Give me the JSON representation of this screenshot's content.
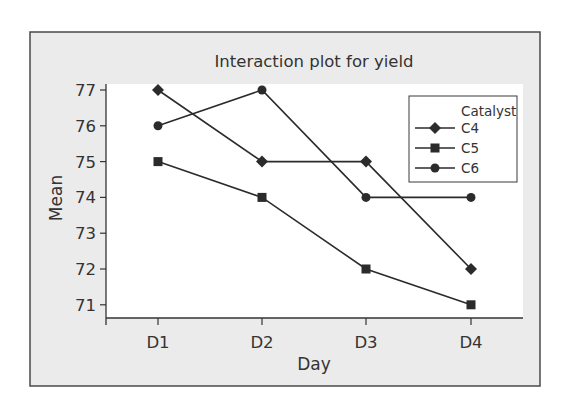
{
  "chart_data": {
    "type": "line",
    "title": "Interaction plot for yield",
    "xlabel": "Day",
    "ylabel": "Mean",
    "categories": [
      "D1",
      "D2",
      "D3",
      "D4"
    ],
    "yticks": [
      71,
      72,
      73,
      74,
      75,
      76,
      77
    ],
    "ylim": [
      70.65,
      77.25
    ],
    "grid": false,
    "legend": {
      "title": "Catalyst",
      "position": "top-right-inside"
    },
    "series": [
      {
        "name": "C4",
        "marker": "diamond",
        "values": [
          77,
          75,
          75,
          72
        ]
      },
      {
        "name": "C5",
        "marker": "square",
        "values": [
          75,
          74,
          72,
          71
        ]
      },
      {
        "name": "C6",
        "marker": "circle",
        "values": [
          76,
          77,
          74,
          74
        ]
      }
    ]
  },
  "colors": {
    "frame_background": "#ebebeb",
    "plot_background": "#ffffff",
    "frame_border": "#4a4a4a",
    "line": "#2b2b2b",
    "text": "#333333"
  }
}
